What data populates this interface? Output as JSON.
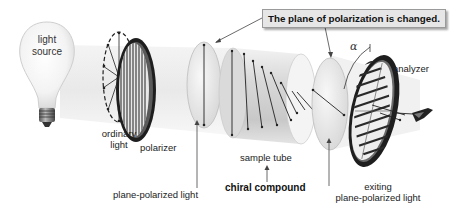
{
  "diagram": {
    "type": "polarimeter-schematic",
    "callout": {
      "text": "The plane of polarization is changed."
    },
    "components": {
      "light_source": {
        "label_line1": "light",
        "label_line2": "source"
      },
      "ordinary_light": {
        "label_line1": "ordinary",
        "label_line2": "light"
      },
      "polarizer": {
        "label": "polarizer"
      },
      "plane_polarized_light": {
        "label": "plane-polarized light"
      },
      "sample_tube": {
        "label": "sample tube"
      },
      "chiral_compound": {
        "label": "chiral compound"
      },
      "exiting_light": {
        "label_line1": "exiting",
        "label_line2": "plane-polarized light"
      },
      "analyzer": {
        "label": "analyzer"
      },
      "rotation_angle": {
        "symbol": "α"
      }
    },
    "colors": {
      "beam": "#ececec",
      "ring": "#2a2a2a",
      "callout_bg": "#e6e6e6",
      "text": "#222222"
    }
  }
}
